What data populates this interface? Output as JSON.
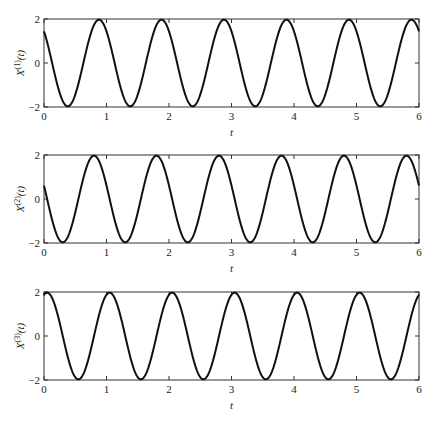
{
  "chart_data": [
    {
      "type": "line",
      "title": "",
      "xlabel": "t",
      "ylabel": "X^(1)(t)",
      "ylabel_base": "X",
      "ylabel_sup": "(1)",
      "ylabel_tail": "(t)",
      "xlim": [
        0,
        6
      ],
      "ylim": [
        -2,
        2
      ],
      "xticks": [
        "0",
        "1",
        "2",
        "3",
        "4",
        "5",
        "6"
      ],
      "yticks": [
        "-2",
        "0",
        "2"
      ],
      "grid": false,
      "legend": null,
      "series": [
        {
          "name": "X1",
          "amplitude": 2,
          "period": 1.0,
          "peak_t": 0.88,
          "description": "2cos(2*pi*(t-0.88))",
          "x": [
            0,
            0.38,
            0.88,
            1.38,
            1.88,
            2.38,
            2.88,
            3.38,
            3.88,
            4.38,
            4.88,
            5.38,
            5.88,
            6
          ],
          "values": [
            1.37,
            -2,
            2,
            -2,
            2,
            -2,
            2,
            -2,
            2,
            -2,
            2,
            -2,
            2,
            1.37
          ]
        }
      ]
    },
    {
      "type": "line",
      "title": "",
      "xlabel": "t",
      "ylabel": "X^(2)(t)",
      "ylabel_base": "X",
      "ylabel_sup": "(2)",
      "ylabel_tail": "(t)",
      "xlim": [
        0,
        6
      ],
      "ylim": [
        -2,
        2
      ],
      "xticks": [
        "0",
        "1",
        "2",
        "3",
        "4",
        "5",
        "6"
      ],
      "yticks": [
        "-2",
        "0",
        "2"
      ],
      "grid": false,
      "legend": null,
      "series": [
        {
          "name": "X2",
          "amplitude": 2,
          "period": 1.0,
          "peak_t": 0.8,
          "description": "2cos(2*pi*(t-0.80))",
          "x": [
            0,
            0.3,
            0.8,
            1.3,
            1.8,
            2.3,
            2.8,
            3.3,
            3.8,
            4.3,
            4.8,
            5.3,
            5.8,
            6
          ],
          "values": [
            0.62,
            -2,
            2,
            -2,
            2,
            -2,
            2,
            -2,
            2,
            -2,
            2,
            -2,
            2,
            0.62
          ]
        }
      ]
    },
    {
      "type": "line",
      "title": "",
      "xlabel": "t",
      "ylabel": "X^(3)(t)",
      "ylabel_base": "X",
      "ylabel_sup": "(3)",
      "ylabel_tail": "(t)",
      "xlim": [
        0,
        6
      ],
      "ylim": [
        -2,
        2
      ],
      "xticks": [
        "0",
        "1",
        "2",
        "3",
        "4",
        "5",
        "6"
      ],
      "yticks": [
        "-2",
        "0",
        "2"
      ],
      "grid": false,
      "legend": null,
      "series": [
        {
          "name": "X3",
          "amplitude": 2,
          "period": 1.0,
          "peak_t": 0.05,
          "description": "2cos(2*pi*(t-0.05))",
          "x": [
            0,
            0.05,
            0.55,
            1.05,
            1.55,
            2.05,
            2.55,
            3.05,
            3.55,
            4.05,
            4.55,
            5.05,
            5.55,
            6
          ],
          "values": [
            1.9,
            2,
            -2,
            2,
            -2,
            2,
            -2,
            2,
            -2,
            2,
            -2,
            2,
            -2,
            1.9
          ]
        }
      ]
    }
  ],
  "style": {
    "line_color": "#111111",
    "frame_color": "#333333",
    "background": "#ffffff"
  }
}
